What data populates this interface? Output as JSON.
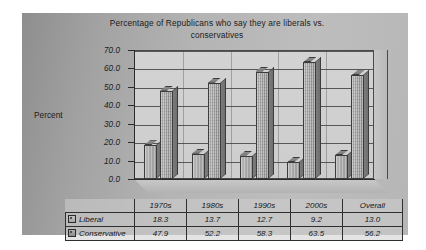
{
  "chart_data": {
    "type": "bar",
    "title": "Percentage of Republicans who say they are liberals vs. conservatives",
    "title_line1": "Percentage of Republicans who say they are liberals vs.",
    "title_line2": "conservatives",
    "xlabel": "",
    "ylabel": "Percent",
    "ylim": [
      0,
      70
    ],
    "ytick_step": 10,
    "yticks": [
      "70.0",
      "60.0",
      "50.0",
      "40.0",
      "30.0",
      "20.0",
      "10.0",
      "0.0"
    ],
    "grid": true,
    "legend_position": "data-table",
    "style": "3d-column",
    "categories": [
      "1970s",
      "1980s",
      "1990s",
      "2000s",
      "Overall"
    ],
    "series": [
      {
        "name": "Liberal",
        "values": [
          18.3,
          13.7,
          12.7,
          9.2,
          13.0
        ],
        "color": "#a6a6a6"
      },
      {
        "name": "Conservative",
        "values": [
          47.9,
          52.2,
          58.3,
          63.5,
          56.2
        ],
        "color": "#9a9a9a"
      }
    ],
    "data_table": {
      "rows": [
        {
          "label": "Liberal",
          "cells": [
            "18.3",
            "13.7",
            "12.7",
            "9.2",
            "13.0"
          ]
        },
        {
          "label": "Conservative",
          "cells": [
            "47.9",
            "52.2",
            "58.3",
            "63.5",
            "56.2"
          ]
        }
      ]
    }
  },
  "colors": {
    "panel_background": "#b4b4b4",
    "plot_wall": "#d0d0d0",
    "axis": "#2b2b2b",
    "gridline": "#575757",
    "text": "#1b1b1b",
    "page_background": "#ffffff"
  }
}
